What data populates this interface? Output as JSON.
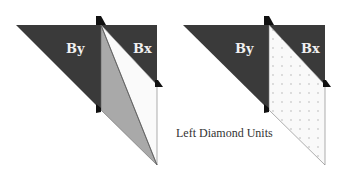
{
  "diagrams": [
    {
      "name": "left-figure",
      "labels": {
        "by": "By",
        "bx": "Bx"
      },
      "fill_middle_left": "#a9a9a9",
      "fill_middle_right": "#fafafa"
    },
    {
      "name": "right-figure",
      "labels": {
        "by": "By",
        "bx": "Bx"
      },
      "fill_middle": "dotted"
    }
  ],
  "caption": "Left Diamond Units",
  "colors": {
    "dark": "#3a3a3a",
    "gray": "#a9a9a9",
    "light": "#fafafa",
    "dot": "#d2d2d2",
    "label": "#f0f0f0",
    "stroke": "#555555"
  }
}
